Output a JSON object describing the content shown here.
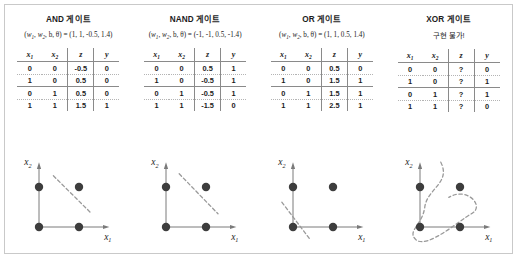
{
  "figure": {
    "background_color": "#ffffff",
    "border_color": "#c9c9c9",
    "point_color": "#3d3d3d",
    "axis_color": "#7a7a7a",
    "boundary_color": "#9a9a9a"
  },
  "table_headers": {
    "x1": "x",
    "x1_sub": "1",
    "x2": "x",
    "x2_sub": "2",
    "z": "z",
    "y": "y"
  },
  "panels": [
    {
      "id": "and",
      "title": "AND 게이트",
      "params": "(w₁, w₂, b, θ) = (1, 1, -0.5, 1.4)",
      "params_prefix": "(",
      "params_w1": "w",
      "params_w1_sub": "1",
      "params_w2": "w",
      "params_w2_sub": "2",
      "params_rest": ", b, θ) = (1, 1, -0.5, 1.4)",
      "rows": [
        {
          "x1": "0",
          "x2": "0",
          "z": "-0.5",
          "y": "0"
        },
        {
          "x1": "1",
          "x2": "0",
          "z": "0.5",
          "y": "0"
        },
        {
          "x1": "0",
          "x2": "1",
          "z": "0.5",
          "y": "0"
        },
        {
          "x1": "1",
          "x2": "1",
          "z": "1.5",
          "y": "1"
        }
      ],
      "plot": {
        "xlabel": "x",
        "xlabel_sub": "1",
        "ylabel": "x",
        "ylabel_sub": "2",
        "points": [
          {
            "x": 0,
            "y": 0,
            "class": 0
          },
          {
            "x": 1,
            "y": 0,
            "class": 0
          },
          {
            "x": 0,
            "y": 1,
            "class": 0
          },
          {
            "x": 1,
            "y": 1,
            "class": 1
          }
        ],
        "boundary_type": "line",
        "boundary": {
          "x1": 0.36,
          "y1": 1.28,
          "x2": 1.3,
          "y2": 0.35
        }
      }
    },
    {
      "id": "nand",
      "title": "NAND 게이트",
      "params": "(w₁, w₂, b, θ) = (-1, -1, 0.5, -1.4)",
      "params_prefix": "(",
      "params_w1": "w",
      "params_w1_sub": "1",
      "params_w2": "w",
      "params_w2_sub": "2",
      "params_rest": ", b, θ) = (-1, -1, 0.5, -1.4)",
      "rows": [
        {
          "x1": "0",
          "x2": "0",
          "z": "0.5",
          "y": "1"
        },
        {
          "x1": "1",
          "x2": "0",
          "z": "-0.5",
          "y": "1"
        },
        {
          "x1": "0",
          "x2": "1",
          "z": "-0.5",
          "y": "1"
        },
        {
          "x1": "1",
          "x2": "1",
          "z": "-1.5",
          "y": "0"
        }
      ],
      "plot": {
        "xlabel": "x",
        "xlabel_sub": "1",
        "ylabel": "x",
        "ylabel_sub": "2",
        "points": [
          {
            "x": 0,
            "y": 0,
            "class": 1
          },
          {
            "x": 1,
            "y": 0,
            "class": 1
          },
          {
            "x": 0,
            "y": 1,
            "class": 1
          },
          {
            "x": 1,
            "y": 1,
            "class": 0
          }
        ],
        "boundary_type": "line",
        "boundary": {
          "x1": 0.33,
          "y1": 1.33,
          "x2": 1.3,
          "y2": 0.33
        }
      }
    },
    {
      "id": "or",
      "title": "OR 게이트",
      "params": "(w₁, w₂, b, θ) = (1, 1, 0.5, 1.4)",
      "params_prefix": "(",
      "params_w1": "w",
      "params_w1_sub": "1",
      "params_w2": "w",
      "params_w2_sub": "2",
      "params_rest": ", b, θ) = (1, 1, 0.5, 1.4)",
      "rows": [
        {
          "x1": "0",
          "x2": "0",
          "z": "0.5",
          "y": "0"
        },
        {
          "x1": "1",
          "x2": "0",
          "z": "1.5",
          "y": "1"
        },
        {
          "x1": "0",
          "x2": "1",
          "z": "1.5",
          "y": "1"
        },
        {
          "x1": "1",
          "x2": "1",
          "z": "2.5",
          "y": "1"
        }
      ],
      "plot": {
        "xlabel": "x",
        "xlabel_sub": "1",
        "ylabel": "x",
        "ylabel_sub": "2",
        "points": [
          {
            "x": 0,
            "y": 0,
            "class": 0
          },
          {
            "x": 1,
            "y": 0,
            "class": 1
          },
          {
            "x": 0,
            "y": 1,
            "class": 1
          },
          {
            "x": 1,
            "y": 1,
            "class": 1
          }
        ],
        "boundary_type": "line",
        "boundary": {
          "x1": -0.28,
          "y1": 0.62,
          "x2": 0.42,
          "y2": -0.3
        }
      }
    },
    {
      "id": "xor",
      "title": "XOR 게이트",
      "params": "구현 불가!",
      "params_is_note": true,
      "rows": [
        {
          "x1": "0",
          "x2": "0",
          "z": "?",
          "y": "0"
        },
        {
          "x1": "1",
          "x2": "0",
          "z": "?",
          "y": "1"
        },
        {
          "x1": "0",
          "x2": "1",
          "z": "?",
          "y": "1"
        },
        {
          "x1": "1",
          "x2": "1",
          "z": "?",
          "y": "0"
        }
      ],
      "plot": {
        "xlabel": "x",
        "xlabel_sub": "1",
        "ylabel": "x",
        "ylabel_sub": "2",
        "points": [
          {
            "x": 0,
            "y": 0,
            "class": 0
          },
          {
            "x": 1,
            "y": 0,
            "class": 1
          },
          {
            "x": 0,
            "y": 1,
            "class": 1
          },
          {
            "x": 1,
            "y": 1,
            "class": 0
          }
        ],
        "boundary_type": "curve"
      }
    }
  ],
  "chart_data": {
    "type": "scatter",
    "xlabel": "x1",
    "ylabel": "x2",
    "xlim": [
      -0.45,
      1.75
    ],
    "ylim": [
      -0.45,
      1.55
    ],
    "grid": false,
    "legend": "none",
    "series": [
      {
        "name": "AND 게이트",
        "parameters": {
          "w1": 1,
          "w2": 1,
          "b": -0.5,
          "theta": 1.4
        },
        "x": [
          0,
          1,
          0,
          1
        ],
        "y": [
          0,
          0,
          1,
          1
        ],
        "z": [
          -0.5,
          0.5,
          0.5,
          1.5
        ],
        "output": [
          0,
          0,
          0,
          1
        ],
        "boundary": "linear"
      },
      {
        "name": "NAND 게이트",
        "parameters": {
          "w1": -1,
          "w2": -1,
          "b": 0.5,
          "theta": -1.4
        },
        "x": [
          0,
          1,
          0,
          1
        ],
        "y": [
          0,
          0,
          1,
          1
        ],
        "z": [
          0.5,
          -0.5,
          -0.5,
          -1.5
        ],
        "output": [
          1,
          1,
          1,
          0
        ],
        "boundary": "linear"
      },
      {
        "name": "OR 게이트",
        "parameters": {
          "w1": 1,
          "w2": 1,
          "b": 0.5,
          "theta": 1.4
        },
        "x": [
          0,
          1,
          0,
          1
        ],
        "y": [
          0,
          0,
          1,
          1
        ],
        "z": [
          0.5,
          1.5,
          1.5,
          2.5
        ],
        "output": [
          0,
          1,
          1,
          1
        ],
        "boundary": "linear"
      },
      {
        "name": "XOR 게이트",
        "parameters": null,
        "x": [
          0,
          1,
          0,
          1
        ],
        "y": [
          0,
          0,
          1,
          1
        ],
        "z": [
          "?",
          "?",
          "?",
          "?"
        ],
        "output": [
          0,
          1,
          1,
          0
        ],
        "boundary": "nonlinear"
      }
    ]
  }
}
